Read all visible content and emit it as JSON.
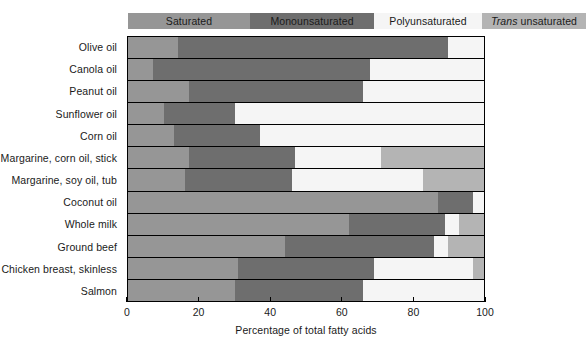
{
  "chart_data": {
    "type": "bar",
    "orientation": "horizontal",
    "stacked": true,
    "title": "",
    "xlabel": "Percentage of total fatty acids",
    "ylabel": "",
    "xlim": [
      0,
      100
    ],
    "xticks": [
      0,
      20,
      40,
      60,
      80,
      100
    ],
    "grid": false,
    "legend_position": "top",
    "categories": [
      "Olive oil",
      "Canola oil",
      "Peanut oil",
      "Sunflower oil",
      "Corn oil",
      "Margarine, corn oil, stick",
      "Margarine, soy oil, tub",
      "Coconut oil",
      "Whole milk",
      "Ground beef",
      "Chicken breast, skinless",
      "Salmon"
    ],
    "series": [
      {
        "name": "Saturated",
        "color": "#969696",
        "values": [
          14,
          7,
          17,
          10,
          13,
          17,
          16,
          87,
          62,
          44,
          31,
          30
        ]
      },
      {
        "name": "Monounsaturated",
        "color": "#6e6e6e",
        "values": [
          76,
          61,
          49,
          20,
          24,
          30,
          30,
          10,
          27,
          42,
          38,
          36
        ]
      },
      {
        "name": "Polyunsaturated",
        "color": "#f5f5f5",
        "values": [
          10,
          32,
          34,
          70,
          63,
          24,
          37,
          3,
          4,
          4,
          28,
          34
        ]
      },
      {
        "name": "Trans unsaturated",
        "color": "#b4b4b4",
        "values": [
          0,
          0,
          0,
          0,
          0,
          29,
          17,
          0,
          7,
          10,
          3,
          0
        ]
      }
    ]
  },
  "legend": {
    "items": [
      {
        "label": "Saturated",
        "italic_prefix": "",
        "color": "#969696",
        "width": 106
      },
      {
        "label": "Monounsaturated",
        "italic_prefix": "",
        "color": "#6e6e6e",
        "width": 108
      },
      {
        "label": "Polyunsaturated",
        "italic_prefix": "",
        "color": "#f5f5f5",
        "width": 92
      },
      {
        "label": " unsaturated",
        "italic_prefix": "Trans",
        "color": "#b4b4b4",
        "width": 88
      }
    ]
  },
  "axis": {
    "x_title": "Percentage of total fatty acids",
    "x_tick_labels": [
      "0",
      "20",
      "40",
      "60",
      "80",
      "100"
    ]
  }
}
